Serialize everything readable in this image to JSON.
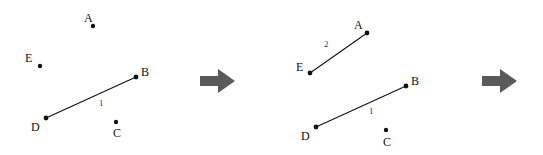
{
  "diagram": {
    "background_color": "#ffffff",
    "point_color": "#111111",
    "line_color": "#111111",
    "arrow_color": "#5a5a5a",
    "panels": [
      {
        "name": "step-1",
        "points": [
          {
            "id": "A",
            "label": "A",
            "x": 93,
            "y": 26,
            "label_x": 84,
            "label_y": 12
          },
          {
            "id": "E",
            "label": "E",
            "x": 40,
            "y": 66,
            "label_x": 25,
            "label_y": 52
          },
          {
            "id": "B",
            "label": "B",
            "x": 136,
            "y": 77,
            "label_x": 141,
            "label_y": 66
          },
          {
            "id": "D",
            "label": "D",
            "x": 46,
            "y": 118,
            "label_x": 31,
            "label_y": 121
          },
          {
            "id": "C",
            "label": "C",
            "x": 116,
            "y": 122,
            "label_x": 113,
            "label_y": 127
          }
        ],
        "segments": [
          {
            "id": "DB",
            "label": "1",
            "from": "D",
            "to": "B",
            "x1": 46,
            "y1": 118,
            "x2": 136,
            "y2": 77,
            "label_x": 99,
            "label_y": 99
          }
        ]
      },
      {
        "name": "step-2",
        "points": [
          {
            "id": "A",
            "label": "A",
            "x": 87,
            "y": 33,
            "label_x": 74,
            "label_y": 19
          },
          {
            "id": "E",
            "label": "E",
            "x": 30,
            "y": 73,
            "label_x": 16,
            "label_y": 61
          },
          {
            "id": "B",
            "label": "B",
            "x": 126,
            "y": 86,
            "label_x": 131,
            "label_y": 75
          },
          {
            "id": "D",
            "label": "D",
            "x": 36,
            "y": 127,
            "label_x": 21,
            "label_y": 130
          },
          {
            "id": "C",
            "label": "C",
            "x": 106,
            "y": 130,
            "label_x": 103,
            "label_y": 136
          }
        ],
        "segments": [
          {
            "id": "EA",
            "label": "2",
            "from": "E",
            "to": "A",
            "x1": 30,
            "y1": 73,
            "x2": 87,
            "y2": 33,
            "label_x": 44,
            "label_y": 40
          },
          {
            "id": "DB",
            "label": "1",
            "from": "D",
            "to": "B",
            "x1": 36,
            "y1": 127,
            "x2": 126,
            "y2": 86,
            "label_x": 89,
            "label_y": 107
          }
        ]
      }
    ],
    "arrows": [
      {
        "name": "step-arrow-1",
        "direction": "right"
      },
      {
        "name": "step-arrow-2",
        "direction": "right"
      }
    ]
  }
}
